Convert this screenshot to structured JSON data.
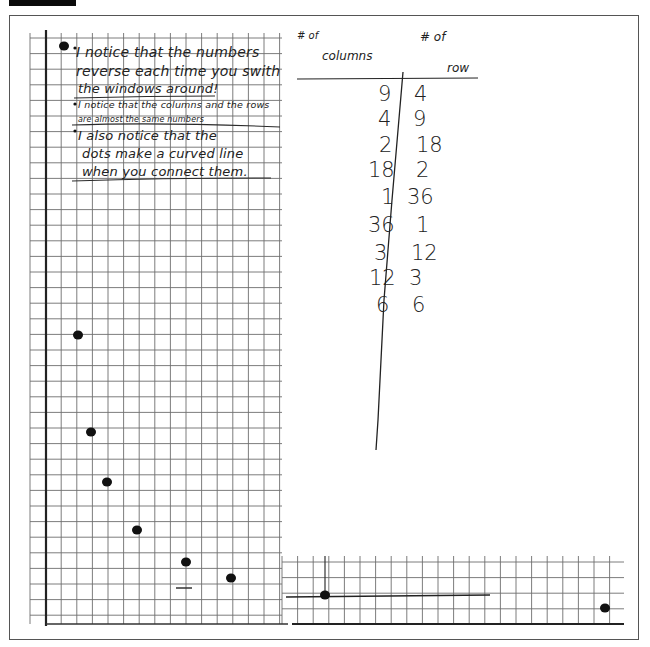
{
  "page": {
    "type": "handwritten-graph-paper-worksheet",
    "frame_border_color": "#555555",
    "grid_line_color": "#6e6e6e",
    "ink_color": "#1e1e1e"
  },
  "notes": {
    "bullets": [
      {
        "lines": [
          "I notice that the numbers",
          "reverse each time you swith",
          "the windows around!"
        ]
      },
      {
        "lines": [
          "I notice that the columns and the rows",
          "are almost the same numbers"
        ]
      },
      {
        "lines": [
          "I also notice that the",
          "dots make a curved line",
          "when you connect them."
        ]
      }
    ]
  },
  "table": {
    "col_header_prefix": "# of",
    "col_header": "columns",
    "row_header_prefix": "# of",
    "row_header": "row",
    "columns": [
      "9",
      "4",
      "2",
      "18",
      "1",
      "36",
      "3",
      "12",
      "6"
    ],
    "rows": [
      "4",
      "9",
      "18",
      "2",
      "36",
      "1",
      "12",
      "3",
      "6"
    ]
  },
  "chart_data": {
    "type": "scatter",
    "title": "",
    "xlabel": "",
    "ylabel": "",
    "grid": true,
    "points": [
      {
        "x": 1,
        "y": 36
      },
      {
        "x": 2,
        "y": 18
      },
      {
        "x": 3,
        "y": 12
      },
      {
        "x": 4,
        "y": 9
      },
      {
        "x": 6,
        "y": 6
      },
      {
        "x": 9,
        "y": 4
      },
      {
        "x": 12,
        "y": 3
      },
      {
        "x": 18,
        "y": 2
      },
      {
        "x": 36,
        "y": 1
      }
    ],
    "pixel_points": [
      [
        64,
        46
      ],
      [
        78,
        335
      ],
      [
        91,
        432
      ],
      [
        107,
        482
      ],
      [
        137,
        530
      ],
      [
        186,
        562
      ],
      [
        231,
        578
      ],
      [
        325,
        595
      ],
      [
        605,
        608
      ]
    ]
  }
}
